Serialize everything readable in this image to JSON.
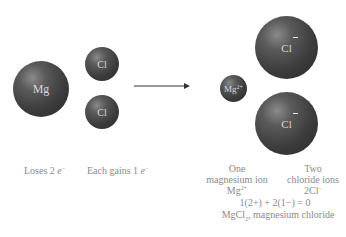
{
  "diagram": {
    "reactants": {
      "magnesium_atom": {
        "symbol": "Mg"
      },
      "chlorine_atoms": [
        {
          "symbol": "Cl"
        },
        {
          "symbol": "Cl"
        }
      ]
    },
    "arrow": "reaction-arrow",
    "products": {
      "magnesium_ion": {
        "symbol": "Mg",
        "charge": "2+"
      },
      "chloride_ions": [
        {
          "symbol": "Cl",
          "charge": "−"
        },
        {
          "symbol": "Cl",
          "charge": "−"
        }
      ]
    },
    "captions": {
      "loses": {
        "text": "Loses 2 ",
        "e": "e",
        "sup": "−"
      },
      "gains": {
        "text": "Each gains 1 ",
        "e": "e",
        "sup": "−"
      },
      "one": "One",
      "magnesium_ion": "magnesium ion",
      "mg_formula": "Mg",
      "mg_charge": "2+",
      "two": "Two",
      "chloride_ions": "chloride ions",
      "cl_formula": "2Cl",
      "cl_charge": "−",
      "charge_balance": "1(2+) + 2(1−) = 0",
      "product_formula_a": "MgCl",
      "product_formula_sub": "2",
      "product_formula_b": ", magnesium chloride"
    }
  }
}
